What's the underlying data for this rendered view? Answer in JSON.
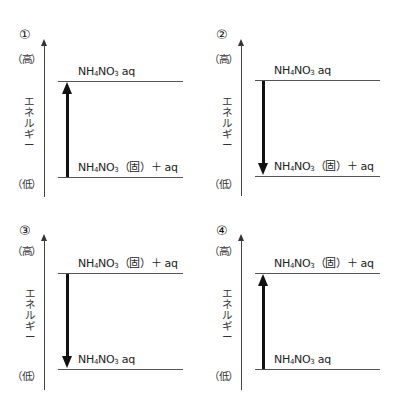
{
  "axis": {
    "label_chars": [
      "エ",
      "ネ",
      "ル",
      "ギ",
      "ー"
    ],
    "high_label": "（高）",
    "low_label": "（低）"
  },
  "species": {
    "aq": {
      "base": "NH",
      "sub1": "4",
      "mid": "NO",
      "sub2": "3",
      "tail": " aq"
    },
    "solid": {
      "base": "NH",
      "sub1": "4",
      "mid": "NO",
      "sub2": "3",
      "tail": "（固）＋ aq"
    }
  },
  "panels": [
    {
      "number": "①",
      "top_level": {
        "base": "NH",
        "sub1": "4",
        "mid": "NO",
        "sub2": "3",
        "tail": " aq"
      },
      "bottom_level": {
        "base": "NH",
        "sub1": "4",
        "mid": "NO",
        "sub2": "3",
        "tail": "（固）＋ aq"
      },
      "arrow_direction": "up"
    },
    {
      "number": "②",
      "top_level": {
        "base": "NH",
        "sub1": "4",
        "mid": "NO",
        "sub2": "3",
        "tail": " aq"
      },
      "bottom_level": {
        "base": "NH",
        "sub1": "4",
        "mid": "NO",
        "sub2": "3",
        "tail": "（固）＋ aq"
      },
      "arrow_direction": "down"
    },
    {
      "number": "③",
      "top_level": {
        "base": "NH",
        "sub1": "4",
        "mid": "NO",
        "sub2": "3",
        "tail": "（固）＋ aq"
      },
      "bottom_level": {
        "base": "NH",
        "sub1": "4",
        "mid": "NO",
        "sub2": "3",
        "tail": " aq"
      },
      "arrow_direction": "down"
    },
    {
      "number": "④",
      "top_level": {
        "base": "NH",
        "sub1": "4",
        "mid": "NO",
        "sub2": "3",
        "tail": "（固）＋ aq"
      },
      "bottom_level": {
        "base": "NH",
        "sub1": "4",
        "mid": "NO",
        "sub2": "3",
        "tail": " aq"
      },
      "arrow_direction": "up"
    }
  ]
}
